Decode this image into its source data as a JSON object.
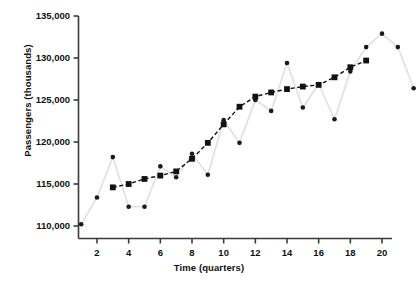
{
  "chart_data": {
    "type": "line",
    "title": "",
    "xlabel": "Time (quarters)",
    "ylabel": "Passengers (thousands)",
    "xlim": [
      0.4,
      22.4
    ],
    "ylim": [
      108400,
      135800
    ],
    "grid": false,
    "legend": null,
    "x": [
      1,
      2,
      3,
      4,
      5,
      6,
      7,
      8,
      9,
      10,
      11,
      12,
      13,
      14,
      15,
      16,
      17,
      18,
      19,
      20,
      21,
      22
    ],
    "xticks": [
      2,
      4,
      6,
      8,
      10,
      12,
      14,
      16,
      18,
      20
    ],
    "xticklabels": [
      "2",
      "4",
      "6",
      "8",
      "10",
      "12",
      "14",
      "16",
      "18",
      "20"
    ],
    "yticks": [
      110000,
      115000,
      120000,
      125000,
      130000,
      135000
    ],
    "yticklabels": [
      "110,000",
      "115,000",
      "120,000",
      "125,000",
      "130,000",
      "135,000"
    ],
    "series": [
      {
        "name": "observed",
        "marker": "circle",
        "marker_color": "#1a1a1a",
        "line_color": "#e0e0e0",
        "values": [
          110200,
          113400,
          118200,
          112300,
          112300,
          117100,
          115800,
          118600,
          116100,
          122600,
          119900,
          125000,
          123700,
          129400,
          124100,
          126900,
          122700,
          128400,
          131300,
          132900,
          131300,
          126400
        ]
      },
      {
        "name": "smoothed",
        "marker": "square",
        "marker_color": "#111111",
        "line_color": "#111111",
        "line_style": "dashed",
        "values": [
          null,
          null,
          114600,
          115000,
          115600,
          116000,
          116500,
          118000,
          119900,
          122100,
          124200,
          125400,
          125900,
          126300,
          126600,
          126800,
          127700,
          128900,
          129700,
          null,
          null,
          null
        ]
      }
    ]
  }
}
